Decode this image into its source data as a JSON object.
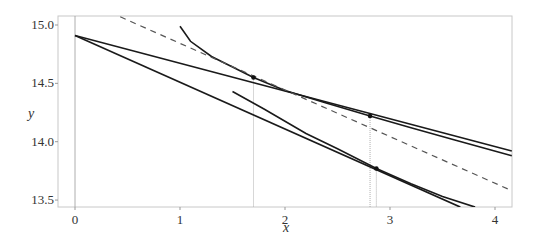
{
  "chart_data": {
    "type": "line",
    "title": "",
    "xlabel": "x",
    "ylabel": "y",
    "xlim": [
      -0.16,
      4.16
    ],
    "ylim": [
      13.44,
      15.08
    ],
    "grid": false,
    "legend": null,
    "x_ticks": [
      0,
      1,
      2,
      3,
      4
    ],
    "x_tick_labels": [
      "0",
      "1",
      "2",
      "3",
      "4"
    ],
    "y_ticks": [
      13.5,
      14.0,
      14.5,
      15.0
    ],
    "y_tick_labels": [
      "13.5",
      "14.0",
      "14.5",
      "15.0"
    ],
    "reference_line_x0": 0,
    "series": [
      {
        "name": "line-a",
        "style": "solid",
        "points": [
          [
            0,
            14.91
          ],
          [
            4.16,
            13.92
          ]
        ]
      },
      {
        "name": "line-b",
        "style": "solid",
        "points": [
          [
            0,
            14.91
          ],
          [
            3.67,
            13.44
          ]
        ]
      },
      {
        "name": "curve-upper",
        "style": "solid",
        "points": [
          [
            1.0,
            14.99
          ],
          [
            1.1,
            14.86
          ],
          [
            1.3,
            14.73
          ],
          [
            1.5,
            14.64
          ],
          [
            1.7,
            14.55
          ],
          [
            2.0,
            14.44
          ],
          [
            2.4,
            14.33
          ],
          [
            2.81,
            14.22
          ],
          [
            3.2,
            14.12
          ],
          [
            3.6,
            14.02
          ],
          [
            4.16,
            13.88
          ]
        ]
      },
      {
        "name": "curve-lower",
        "style": "solid",
        "points": [
          [
            1.5,
            14.43
          ],
          [
            1.8,
            14.28
          ],
          [
            2.2,
            14.07
          ],
          [
            2.5,
            13.94
          ],
          [
            2.87,
            13.77
          ],
          [
            3.2,
            13.64
          ],
          [
            3.5,
            13.53
          ],
          [
            3.81,
            13.44
          ]
        ]
      },
      {
        "name": "dashed-line",
        "style": "dashed",
        "points": [
          [
            0.43,
            15.07
          ],
          [
            4.16,
            13.58
          ]
        ]
      }
    ],
    "markers": [
      {
        "x": 1.7,
        "y": 14.55
      },
      {
        "x": 2.81,
        "y": 14.22
      },
      {
        "x": 2.87,
        "y": 13.77
      }
    ],
    "drop_lines_x": [
      1.7,
      2.81,
      2.87
    ]
  }
}
